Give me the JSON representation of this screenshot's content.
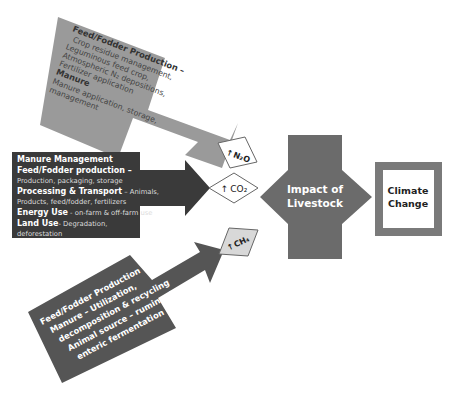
{
  "colors": {
    "top_box": "#9a9a9a",
    "top_box_text": "#333333",
    "middle_box": "#3a3a3a",
    "middle_box_text": "#ffffff",
    "bottom_box": "#555555",
    "bottom_box_text": "#ffffff",
    "impact_shape": "#6b6b6b",
    "climate_frame": "#7a7a7a",
    "n2o_fill": "#ffffff",
    "co2_fill": "#ffffff",
    "ch4_fill": "#d8d8d8"
  },
  "top_source": {
    "lines": [
      {
        "text": "Feed/Fodder Production –",
        "bold": true
      },
      {
        "text": "Crop residue management,",
        "bold": false
      },
      {
        "text": "Leguminous feed crop,",
        "bold": false
      },
      {
        "text": "Atmospheric N₂ depositions,",
        "bold": false
      },
      {
        "text": "Fertilizer application",
        "bold": false
      },
      {
        "text": "Manure",
        "bold": true
      },
      {
        "text": "Manure application, storage,",
        "bold": false
      },
      {
        "text": "management",
        "bold": false
      }
    ]
  },
  "middle_source": {
    "lines": [
      [
        {
          "text": "Manure Management",
          "bold": true
        }
      ],
      [
        {
          "text": "Feed/Fodder production –",
          "bold": true
        }
      ],
      [
        {
          "text": "Production, packaging, storage",
          "bold": false
        }
      ],
      [
        {
          "text": "Processing & Transport",
          "bold": true
        },
        {
          "text": " – Animals,",
          "bold": false
        }
      ],
      [
        {
          "text": "Products, feed/fodder, fertilizers",
          "bold": false
        }
      ],
      [
        {
          "text": "Energy Use",
          "bold": true
        },
        {
          "text": " - on-farm & off-farm use",
          "bold": false
        }
      ],
      [
        {
          "text": "Land Use",
          "bold": true
        },
        {
          "text": "- Degradation,",
          "bold": false
        }
      ],
      [
        {
          "text": "deforestation",
          "bold": false
        }
      ]
    ]
  },
  "bottom_source": {
    "lines": [
      "Feed/Fodder Production",
      "Manure – Utilization,",
      "decomposition & recycling",
      "Animal source – ruminant",
      "enteric fermentation"
    ]
  },
  "gases": {
    "n2o": {
      "arrow": "↑",
      "label": "N₂O"
    },
    "co2": {
      "arrow": "↑",
      "label": "CO₂"
    },
    "ch4": {
      "arrow": "↑",
      "label": "CH₄"
    }
  },
  "impact": {
    "line1": "Impact of",
    "line2": "Livestock"
  },
  "climate": {
    "line1": "Climate",
    "line2": "Change"
  }
}
